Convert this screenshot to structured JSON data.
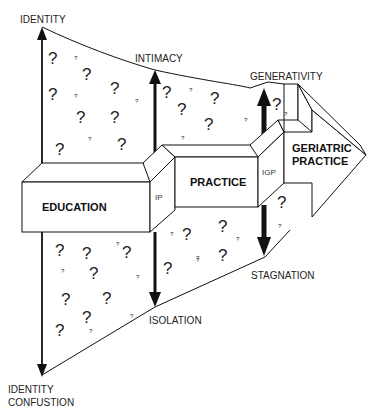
{
  "diagram": {
    "stages": {
      "identity": "IDENTITY",
      "intimacy": "INTIMACY",
      "generativity": "GENERATIVITY",
      "identity_confusion_line1": "IDENTITY",
      "identity_confusion_line2": "CONFUSTION",
      "isolation": "ISOLATION",
      "stagnation": "STAGNATION"
    },
    "boxes": {
      "education": "EDUCATION",
      "ip": "IP",
      "practice": "PRACTICE",
      "igp": "IGP",
      "geriatric_line1": "GERIATRIC",
      "geriatric_line2": "PRACTICE"
    },
    "question_mark": "?",
    "colors": {
      "line": "#111111",
      "text": "#222222",
      "background": "#ffffff"
    }
  }
}
